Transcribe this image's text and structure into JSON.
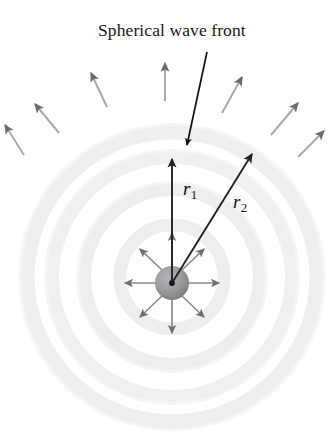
{
  "figure": {
    "title": "Spherical wave front",
    "background_color": "#ffffff",
    "width": 335,
    "height": 434
  },
  "labels": {
    "title": "Spherical wave front",
    "r1_symbol": "r",
    "r1_subscript": "1",
    "r2_symbol": "r",
    "r2_subscript": "2"
  },
  "colors": {
    "text": "#161616",
    "leader_line": "#101010",
    "radius_arrow": "#20202a",
    "inner_arrow": "#8a8a92",
    "inner_arrowhead": "#6e6e78",
    "outer_arrow_shaft": "#a9a9b0",
    "outer_arrowhead": "#6a6a72",
    "source_sphere": "#9a9a9e",
    "source_sphere_dark": "#7c7c82",
    "source_center_dot": "#121212",
    "wavefront_ring": "#efeff1",
    "wavefront_ring_edge": "#e4e4e7"
  },
  "diagram": {
    "source": {
      "cx": 172,
      "cy": 283,
      "r": 17,
      "center_dot_r": 3
    },
    "wavefronts": {
      "count": 4,
      "center": {
        "cx": 172,
        "cy": 277
      },
      "radii": [
        52,
        88,
        120,
        145
      ],
      "band_width": 15
    },
    "radius_vectors": [
      {
        "name": "r1",
        "from": [
          172,
          283
        ],
        "to": [
          172,
          158
        ],
        "label": "r1"
      },
      {
        "name": "r2",
        "from": [
          172,
          283
        ],
        "to": [
          254,
          152
        ],
        "label": "r2"
      }
    ],
    "inner_arrows": {
      "count": 8,
      "length": 32,
      "angles_deg": [
        270,
        315,
        0,
        45,
        90,
        135,
        180,
        225
      ]
    },
    "outer_arrows": {
      "count": 7,
      "items": [
        {
          "from": [
            24,
            155
          ],
          "to": [
            4,
            124
          ]
        },
        {
          "from": [
            59,
            133
          ],
          "to": [
            34,
            103
          ]
        },
        {
          "from": [
            107,
            107
          ],
          "to": [
            90,
            72
          ]
        },
        {
          "from": [
            165,
            101
          ],
          "to": [
            165,
            62
          ]
        },
        {
          "from": [
            222,
            113
          ],
          "to": [
            243,
            76
          ]
        },
        {
          "from": [
            271,
            135
          ],
          "to": [
            299,
            102
          ]
        },
        {
          "from": [
            298,
            157
          ],
          "to": [
            325,
            130
          ]
        }
      ]
    },
    "leader_line": {
      "from": [
        207,
        52
      ],
      "to": [
        186,
        146
      ]
    }
  }
}
